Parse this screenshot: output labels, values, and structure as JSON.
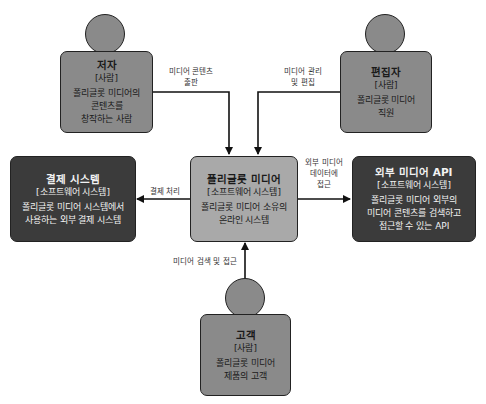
{
  "diagram": {
    "type": "C4 system context",
    "colors": {
      "person_fill": "#8a8a8a",
      "central_fill": "#a9a9a9",
      "external_fill": "#3b3b3b",
      "stroke": "#222222"
    },
    "nodes": {
      "author": {
        "title": "저자",
        "type": "[사람]",
        "desc_line1": "폴리글롯 미디어의",
        "desc_line2": "콘텐츠를",
        "desc_line3": "창작하는 사람"
      },
      "editor": {
        "title": "편집자",
        "type": "[사람]",
        "desc_line1": "폴리글롯 미디어",
        "desc_line2": "직원"
      },
      "payment": {
        "title": "결제 시스템",
        "type": "[소프트웨어 시스템]",
        "desc_line1": "폴리글롯 미디어 시스템에서",
        "desc_line2": "사용하는 외부 결제 시스템"
      },
      "central": {
        "title": "폴리글롯 미디어",
        "type": "[소프트웨어 시스템]",
        "desc_line1": "폴리글롯 미디어 소유의",
        "desc_line2": "온라인 시스템"
      },
      "api": {
        "title": "외부 미디어 API",
        "type": "[소프트웨어 시스템]",
        "desc_line1": "폴리글롯 미디어 외부의",
        "desc_line2": "미디어 콘텐츠를 검색하고",
        "desc_line3": "접근할 수 있는 API"
      },
      "customer": {
        "title": "고객",
        "type": "[사람]",
        "desc_line1": "폴리글롯 미디어",
        "desc_line2": "제품의 고객"
      }
    },
    "edges": {
      "author_to_central": {
        "line1": "미디어 콘텐츠",
        "line2": "출판"
      },
      "editor_to_central": {
        "line1": "미디어 관리",
        "line2": "및 편집"
      },
      "central_to_payment": {
        "line1": "결제 처리"
      },
      "central_to_api": {
        "line1": "외부 미디어",
        "line2": "데이터에",
        "line3": "접근"
      },
      "customer_to_central": {
        "line1": "미디어 검색 및 접근"
      }
    }
  }
}
